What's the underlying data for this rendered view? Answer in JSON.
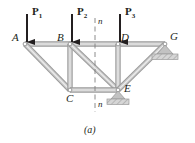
{
  "figure": {
    "caption": "(a)",
    "colors": {
      "member_fill": "#c9c9c9",
      "member_edge": "#9a9a9a",
      "ink": "#231f20",
      "support_hatch": "#b3b3b3",
      "dashed": "#808080",
      "background": "#ffffff"
    }
  },
  "joints": [
    {
      "id": "A",
      "label": "A",
      "x": 25,
      "y": 44,
      "label_dx": -13,
      "label_dy": -12
    },
    {
      "id": "B",
      "label": "B",
      "x": 70,
      "y": 44,
      "label_dx": -13,
      "label_dy": -12
    },
    {
      "id": "D",
      "label": "D",
      "x": 118,
      "y": 44,
      "label_dx": 3,
      "label_dy": -12
    },
    {
      "id": "G",
      "label": "G",
      "x": 165,
      "y": 44,
      "label_dx": 5,
      "label_dy": -13
    },
    {
      "id": "C",
      "label": "C",
      "x": 70,
      "y": 90,
      "label_dx": -4,
      "label_dy": 3
    },
    {
      "id": "E",
      "label": "E",
      "x": 118,
      "y": 90,
      "label_dx": 6,
      "label_dy": -7
    }
  ],
  "members": [
    {
      "from": "A",
      "to": "B",
      "name": "top-chord-AB"
    },
    {
      "from": "B",
      "to": "D",
      "name": "top-chord-BD"
    },
    {
      "from": "D",
      "to": "G",
      "name": "top-chord-DG"
    },
    {
      "from": "A",
      "to": "C",
      "name": "diagonal-AC"
    },
    {
      "from": "B",
      "to": "C",
      "name": "vertical-BC"
    },
    {
      "from": "B",
      "to": "E",
      "name": "diagonal-BE"
    },
    {
      "from": "D",
      "to": "E",
      "name": "vertical-DE"
    },
    {
      "from": "C",
      "to": "E",
      "name": "bottom-chord-CE"
    },
    {
      "from": "E",
      "to": "G",
      "name": "diagonal-EG"
    }
  ],
  "loads": [
    {
      "id": "P1",
      "label": "P",
      "sub": "1",
      "at_joint": "A",
      "x": 27,
      "arrow_top": 14,
      "arrow_bottom": 42,
      "label_x": 32,
      "label_y": 6
    },
    {
      "id": "P2",
      "label": "P",
      "sub": "2",
      "at_joint": "B",
      "x": 72,
      "arrow_top": 14,
      "arrow_bottom": 42,
      "label_x": 77,
      "label_y": 6
    },
    {
      "id": "P3",
      "label": "P",
      "sub": "3",
      "at_joint": "D",
      "x": 120,
      "arrow_top": 14,
      "arrow_bottom": 42,
      "label_x": 125,
      "label_y": 6
    }
  ],
  "section_line": {
    "id": "n-n",
    "label_top": "n",
    "label_bottom": "n",
    "x": 95,
    "y_top": 18,
    "y_bottom": 112,
    "label_top_x": 98,
    "label_top_y": 17,
    "label_bottom_x": 98,
    "label_bottom_y": 100
  },
  "supports": [
    {
      "id": "E",
      "type": "pin",
      "at_joint": "E",
      "x": 118,
      "y": 90
    },
    {
      "id": "G",
      "type": "roller",
      "at_joint": "G",
      "x": 165,
      "y": 44
    }
  ]
}
